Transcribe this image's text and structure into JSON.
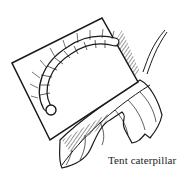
{
  "illustration": {
    "subject": "tent-caterpillar",
    "caption": "Tent caterpillar",
    "colors": {
      "ink": "#1a1a1a",
      "background": "#ffffff"
    }
  }
}
